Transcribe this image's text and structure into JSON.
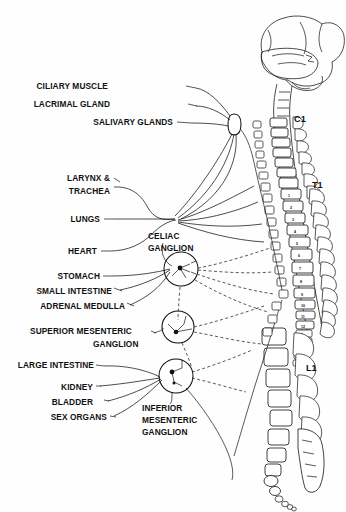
{
  "figure": {
    "background_color": "#fefefe",
    "ink_color": "#111111"
  },
  "organ_labels": [
    {
      "id": "ciliary-muscle",
      "text": "CILIARY MUSCLE",
      "x": 108,
      "y": 89
    },
    {
      "id": "lacrimal-gland",
      "text": "LACRIMAL GLAND",
      "x": 104,
      "y": 107
    },
    {
      "id": "salivary-glands",
      "text": "SALIVARY GLANDS",
      "x": 96,
      "y": 125
    },
    {
      "id": "larynx-trachea-1",
      "text": "LARYNX &",
      "x": 70,
      "y": 181
    },
    {
      "id": "larynx-trachea-2",
      "text": "TRACHEA",
      "x": 73,
      "y": 194
    },
    {
      "id": "lungs",
      "text": "LUNGS",
      "x": 75,
      "y": 222
    },
    {
      "id": "heart",
      "text": "HEART",
      "x": 76,
      "y": 254
    },
    {
      "id": "stomach",
      "text": "STOMACH",
      "x": 55,
      "y": 279
    },
    {
      "id": "small-intestine",
      "text": "SMALL INTESTINE",
      "x": 42,
      "y": 294
    },
    {
      "id": "adrenal-medulla",
      "text": "ADRENAL MEDULLA",
      "x": 47,
      "y": 309
    },
    {
      "id": "large-intestine",
      "text": "LARGE INTESTINE",
      "x": 19,
      "y": 368
    },
    {
      "id": "kidney",
      "text": "KIDNEY",
      "x": 63,
      "y": 390
    },
    {
      "id": "bladder",
      "text": "BLADDER",
      "x": 63,
      "y": 405
    },
    {
      "id": "sex-organs",
      "text": "SEX ORGANS",
      "x": 45,
      "y": 420
    }
  ],
  "ganglion_labels": [
    {
      "id": "celiac-ganglion",
      "lines": [
        "CELIAC",
        "GANGLION"
      ],
      "x": 148,
      "y": 233
    },
    {
      "id": "superior-mesenteric-ganglion",
      "lines": [
        "SUPERIOR  MESENTERIC",
        "GANGLION"
      ],
      "x": 30,
      "y": 333
    },
    {
      "id": "inferior-mesenteric-ganglion",
      "lines": [
        "INFERIOR",
        "MESENTERIC",
        "GANGLION"
      ],
      "x": 142,
      "y": 409
    }
  ],
  "spine_levels": [
    {
      "id": "c1",
      "text": "C1",
      "x": 294,
      "y": 122
    },
    {
      "id": "t1",
      "text": "T1",
      "x": 312,
      "y": 188
    },
    {
      "id": "l1",
      "text": "L1",
      "x": 306,
      "y": 371
    }
  ],
  "vertebra_numbers": {
    "thoracic": [
      "1",
      "2",
      "3",
      "4",
      "5",
      "6",
      "7",
      "8",
      "9",
      "10",
      "11",
      "12"
    ],
    "lumbar": [
      "1",
      "2",
      "3",
      "4",
      "5"
    ]
  },
  "anatomy": {
    "brain": "brain-cerebrum-cerebellum",
    "spinal_cord": "spinal-cord",
    "sympathetic_chain": "sympathetic-chain-ganglia",
    "cervical_ganglion": "superior-cervical-ganglion",
    "prevertebral_ganglia": [
      "celiac",
      "superior-mesenteric",
      "inferior-mesenteric"
    ],
    "sacrum": "sacrum",
    "coccyx": "coccyx"
  }
}
